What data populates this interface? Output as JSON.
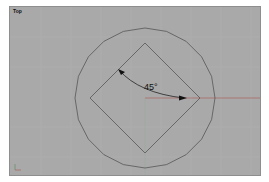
{
  "viewport": {
    "label": "Top",
    "background_color": "#a9a9a9",
    "grid_color": "#b4b4b4",
    "x_axis_color": "#b05555"
  },
  "drawing": {
    "objects": [
      {
        "type": "polygon-circle",
        "segments": 20,
        "color": "#4a4a4a"
      },
      {
        "type": "rotated-square",
        "rotation_deg": 45,
        "color": "#4a4a4a"
      },
      {
        "type": "angle-dimension",
        "text": "45°",
        "color": "#111111"
      }
    ]
  }
}
